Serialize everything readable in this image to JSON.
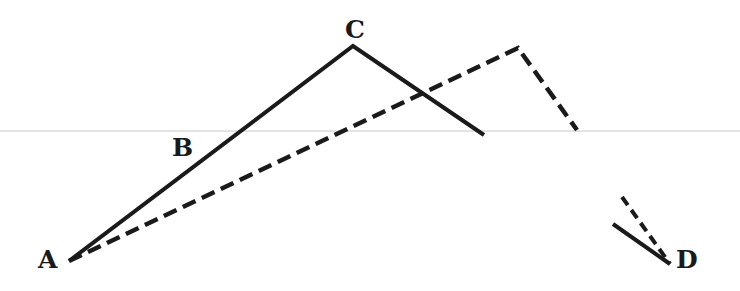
{
  "diagram": {
    "colors": {
      "ink": "#1a1a1a",
      "rule": "#c8c8c8",
      "background": "#ffffff"
    },
    "labels": {
      "A": "A",
      "B": "B",
      "C": "C",
      "D": "D"
    },
    "points": {
      "A": [
        69,
        261
      ],
      "C": [
        353,
        46
      ],
      "solid_end": [
        484,
        135
      ],
      "dashed_peak": [
        518,
        48
      ],
      "dashed_end": [
        577,
        130
      ],
      "D": [
        670,
        264
      ],
      "solid_near_D_start": [
        613,
        224
      ],
      "dashed_near_D_start": [
        622,
        197
      ]
    },
    "segments": [
      {
        "style": "solid",
        "from": "A",
        "to": "C"
      },
      {
        "style": "solid",
        "from": "C",
        "to": "solid_end"
      },
      {
        "style": "dashed",
        "from": "A",
        "to": "dashed_peak"
      },
      {
        "style": "dashed",
        "from": "dashed_peak",
        "to": "dashed_end"
      },
      {
        "style": "solid",
        "from": "solid_near_D_start",
        "to": "D"
      },
      {
        "style": "dashed",
        "from": "dashed_near_D_start",
        "to": "D"
      }
    ],
    "horizontal_rule_y": 131
  }
}
